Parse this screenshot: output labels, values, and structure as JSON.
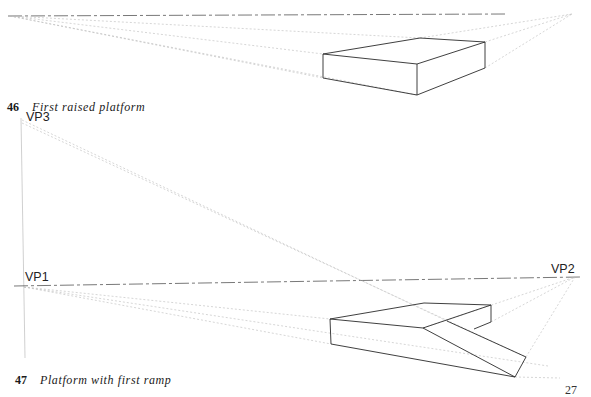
{
  "figures": [
    {
      "number": "46",
      "title": "First raised platform"
    },
    {
      "number": "47",
      "title": "Platform with first ramp",
      "labels": {
        "vp1": "VP1",
        "vp2": "VP2",
        "vp3": "VP3"
      }
    }
  ],
  "page_number": "27",
  "colors": {
    "ink": "#2a2a2a",
    "construction": "#b8b8b8"
  }
}
